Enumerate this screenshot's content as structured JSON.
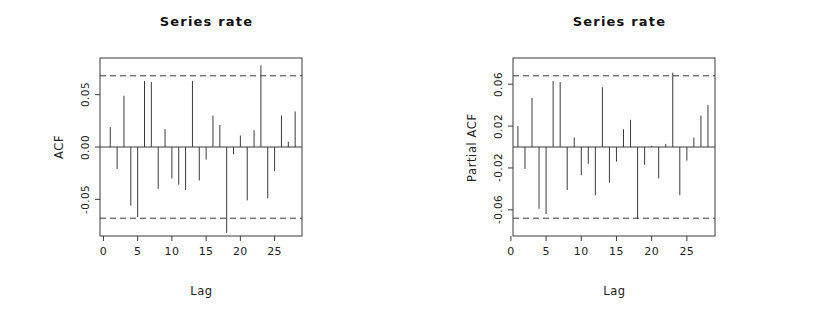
{
  "figure": {
    "background": "#ffffff",
    "foreground": "#2b2b2b",
    "panels": 2
  },
  "panels": [
    {
      "key": "acf",
      "title": "Series  rate",
      "xlabel": "Lag",
      "ylabel": "ACF"
    },
    {
      "key": "pacf",
      "title": "Series  rate",
      "xlabel": "Lag",
      "ylabel": "Partial ACF"
    }
  ],
  "chart_data": [
    {
      "type": "bar",
      "name": "acf",
      "title": "Series  rate",
      "xlabel": "Lag",
      "ylabel": "ACF",
      "grid": false,
      "legend": false,
      "xlim": [
        -0.5,
        29
      ],
      "ylim": [
        -0.085,
        0.085
      ],
      "xticks": [
        0,
        5,
        10,
        15,
        20,
        25
      ],
      "xticklabels": [
        "0",
        "5",
        "10",
        "15",
        "20",
        "25"
      ],
      "yticks": [
        0.05,
        0.0,
        -0.05
      ],
      "yticklabels": [
        "0.05",
        "0.00",
        "-0.05"
      ],
      "confidence_bands": [
        0.068,
        -0.068
      ],
      "confidence_style": "dashed",
      "baseline": 0.0,
      "x": [
        1,
        2,
        3,
        4,
        5,
        6,
        7,
        8,
        9,
        10,
        11,
        12,
        13,
        14,
        15,
        16,
        17,
        18,
        19,
        20,
        21,
        22,
        23,
        24,
        25,
        26,
        27,
        28
      ],
      "values": [
        0.019,
        -0.021,
        0.049,
        -0.056,
        -0.067,
        0.063,
        0.062,
        -0.04,
        0.017,
        -0.03,
        -0.036,
        -0.041,
        0.063,
        -0.032,
        -0.012,
        0.03,
        0.021,
        -0.082,
        -0.007,
        0.011,
        -0.051,
        0.016,
        0.078,
        -0.049,
        -0.023,
        0.03,
        0.005,
        0.034
      ]
    },
    {
      "type": "bar",
      "name": "pacf",
      "title": "Series  rate",
      "xlabel": "Lag",
      "ylabel": "Partial ACF",
      "grid": false,
      "legend": false,
      "xlim": [
        0.3,
        29
      ],
      "ylim": [
        -0.085,
        0.085
      ],
      "xticks": [
        0,
        5,
        10,
        15,
        20,
        25
      ],
      "xticklabels": [
        "0",
        "5",
        "10",
        "15",
        "20",
        "25"
      ],
      "yticks": [
        0.06,
        0.02,
        -0.02,
        -0.06
      ],
      "yticklabels": [
        "0.06",
        "0.02",
        "-0.02",
        "-0.06"
      ],
      "confidence_bands": [
        0.068,
        -0.068
      ],
      "confidence_style": "dashed",
      "baseline": 0.0,
      "x": [
        1,
        2,
        3,
        4,
        5,
        6,
        7,
        8,
        9,
        10,
        11,
        12,
        13,
        14,
        15,
        16,
        17,
        18,
        19,
        20,
        21,
        22,
        23,
        24,
        25,
        26,
        27,
        28
      ],
      "values": [
        0.02,
        -0.021,
        0.047,
        -0.059,
        -0.064,
        0.063,
        0.062,
        -0.041,
        0.009,
        -0.027,
        -0.016,
        -0.046,
        0.057,
        -0.034,
        -0.014,
        0.017,
        0.026,
        -0.069,
        -0.017,
        0.001,
        -0.03,
        0.003,
        0.071,
        -0.046,
        -0.013,
        0.009,
        0.03,
        0.04
      ]
    }
  ]
}
